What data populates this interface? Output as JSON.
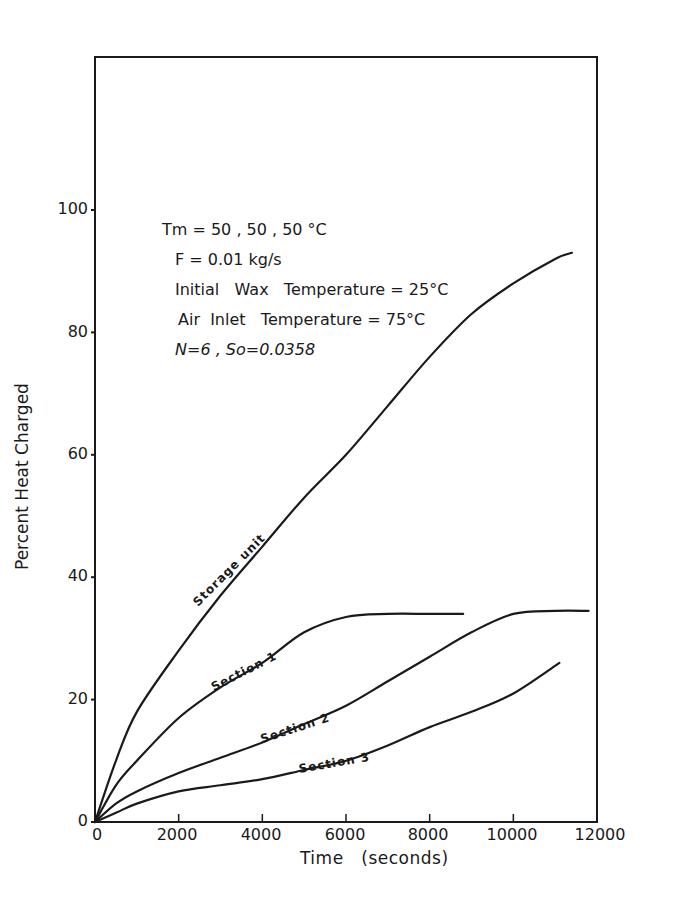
{
  "chart_data": {
    "type": "line",
    "title": "",
    "xlabel": "Time   (seconds)",
    "ylabel": "Percent   Heat   Charged",
    "xlim": [
      0,
      12000
    ],
    "ylim": [
      0,
      100
    ],
    "x_ticks": [
      "0",
      "2000",
      "4000",
      "6000",
      "8000",
      "10000",
      "12000"
    ],
    "y_ticks": [
      "0",
      "20",
      "40",
      "60",
      "80",
      "100"
    ],
    "grid": false,
    "legend": "inline curve labels",
    "annotations": [
      "Tm = 50 , 50 , 50 °C",
      "F = 0.01 kg/s",
      "Initial   Wax   Temperature = 25°C",
      "Air  Inlet   Temperature = 75°C",
      "N=6 , So=0.0358"
    ],
    "series": [
      {
        "name": "Storage unit",
        "x": [
          0,
          500,
          1000,
          2000,
          3000,
          4000,
          5000,
          6000,
          7000,
          8000,
          9000,
          10000,
          11000,
          11400
        ],
        "y": [
          0,
          10,
          18,
          28,
          37,
          45,
          53,
          60,
          68,
          76,
          83,
          88,
          92,
          93
        ]
      },
      {
        "name": "Section 1",
        "x": [
          0,
          500,
          1000,
          2000,
          3000,
          4000,
          5000,
          6000,
          7000,
          8000,
          8800
        ],
        "y": [
          0,
          6,
          10,
          17,
          22,
          26,
          31,
          33.5,
          34,
          34,
          34
        ]
      },
      {
        "name": "Section 2",
        "x": [
          0,
          500,
          1000,
          2000,
          3000,
          4000,
          5000,
          6000,
          7000,
          8000,
          9000,
          10000,
          11000,
          11800
        ],
        "y": [
          0,
          3,
          5,
          8,
          10.5,
          13,
          16,
          19,
          23,
          27,
          31,
          34,
          34.5,
          34.5
        ]
      },
      {
        "name": "Section 3",
        "x": [
          0,
          500,
          1000,
          2000,
          3000,
          4000,
          5000,
          6000,
          7000,
          8000,
          9000,
          10000,
          11100
        ],
        "y": [
          0,
          1.5,
          3,
          5,
          6,
          7,
          8.5,
          10,
          12.5,
          15.5,
          18,
          21,
          26
        ]
      }
    ]
  },
  "labels": {
    "ylabel": "Percent   Heat   Charged",
    "xlabel": "Time   (seconds)",
    "notes": [
      "Tm = 50 , 50 , 50 °C",
      "F = 0.01 kg/s",
      "Initial   Wax   Temperature = 25°C",
      "Air  Inlet   Temperature = 75°C",
      "N=6 , So=0.0358"
    ],
    "curves": [
      "Storage  unit",
      "Section  1",
      "Section  2",
      "Section  3"
    ],
    "yticks": [
      "0",
      "20",
      "40",
      "60",
      "80",
      "100"
    ],
    "xticks": [
      "0",
      "2000",
      "4000",
      "6000",
      "8000",
      "10000",
      "12000"
    ]
  }
}
